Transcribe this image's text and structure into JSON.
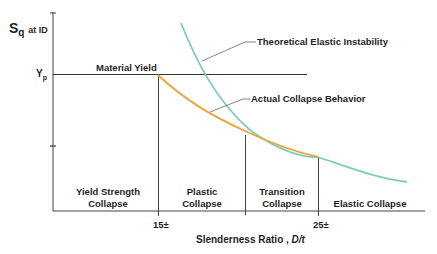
{
  "y_axis": {
    "label_main": "S",
    "label_sub": "q",
    "label_suffix": "at ID",
    "tick_label": "Y",
    "tick_label_sub": "p"
  },
  "x_axis": {
    "label": "Slenderness Ratio ,",
    "label_italic": "D/t",
    "ticks": [
      "15±",
      "25±"
    ]
  },
  "lines": {
    "material_yield": "Material Yield",
    "theoretical": "Theoretical Elastic Instability",
    "actual": "Actual Collapse Behavior"
  },
  "regions": {
    "yield_1": "Yield Strength",
    "yield_2": "Collapse",
    "plastic_1": "Plastic",
    "plastic_2": "Collapse",
    "transition_1": "Transition",
    "transition_2": "Collapse",
    "elastic": "Elastic Collapse"
  },
  "colors": {
    "theoretical_curve": "#7ccbbf",
    "actual_curve": "#f0a238",
    "axis": "#333333",
    "leader": "#777777"
  }
}
